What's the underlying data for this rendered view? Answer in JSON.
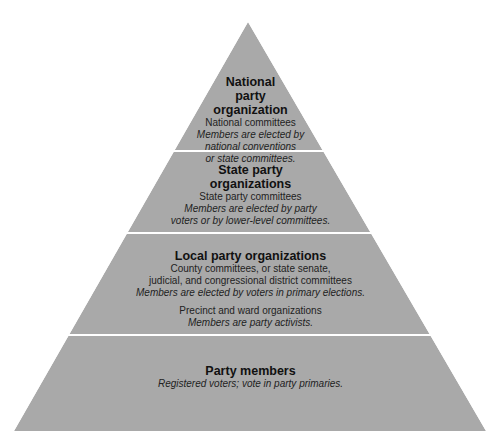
{
  "diagram": {
    "type": "pyramid",
    "fill_color": "#a9a9a9",
    "separator_color": "#ffffff",
    "tiers": [
      {
        "title_lines": [
          "National",
          "party",
          "organization"
        ],
        "description": "National committees",
        "membership_lines": [
          "Members are elected by",
          "national conventions",
          "or state committees."
        ]
      },
      {
        "title_lines": [
          "State party",
          "organizations"
        ],
        "description": "State party committees",
        "membership_lines": [
          "Members are elected by party",
          "voters or by lower-level committees."
        ]
      },
      {
        "title_lines": [
          "Local party organizations"
        ],
        "description_lines": [
          "County committees, or state senate,",
          "judicial, and congressional district committees"
        ],
        "membership": "Members are elected by voters in primary elections.",
        "sub_description": "Precinct and ward organizations",
        "sub_membership": "Members are party activists."
      },
      {
        "title_lines": [
          "Party members"
        ],
        "membership": "Registered voters; vote in party primaries."
      }
    ]
  }
}
